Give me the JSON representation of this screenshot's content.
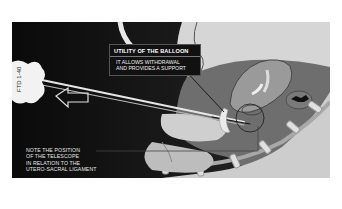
{
  "figure": {
    "callout": {
      "title": "UTILITY OF THE BALLOON",
      "body_line1": "IT ALLOWS WITHDRAWAL",
      "body_line2": "AND PROVIDES A SUPPORT"
    },
    "note": {
      "line1": "NOTE THE POSITION",
      "line2": "OF THE TELESCOPE",
      "line3": "IN RELATION TO THE",
      "line4": "UTERO-SACRAL LIGAMENT"
    },
    "instrument_label": "FTD 1-40",
    "colors": {
      "background": "#0d0d0d",
      "tissue_light": "#cfcfcf",
      "tissue_mid": "#8a8a8a",
      "tissue_dark": "#4a4a4a",
      "outline": "#ffffff"
    }
  }
}
